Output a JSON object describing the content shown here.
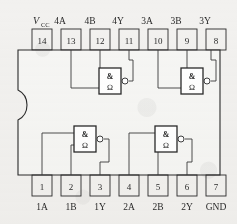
{
  "figure": {
    "kind": "ic-pinout-diagram",
    "device": "quad 2-input NAND (DIP-14)",
    "package_outline_color": "#2a2a2a",
    "background_color": "#f2f1ef",
    "wire_color": "#3a3a3a"
  },
  "pins": {
    "top": [
      {
        "number": "14",
        "label": "V",
        "sub": "CC",
        "is_vcc": true
      },
      {
        "number": "13",
        "label": "4A"
      },
      {
        "number": "12",
        "label": "4B"
      },
      {
        "number": "11",
        "label": "4Y"
      },
      {
        "number": "10",
        "label": "3A"
      },
      {
        "number": "9",
        "label": "3B"
      },
      {
        "number": "8",
        "label": "3Y"
      }
    ],
    "bottom": [
      {
        "number": "1",
        "label": "1A"
      },
      {
        "number": "2",
        "label": "1B"
      },
      {
        "number": "3",
        "label": "1Y"
      },
      {
        "number": "4",
        "label": "2A"
      },
      {
        "number": "5",
        "label": "2B"
      },
      {
        "number": "6",
        "label": "2Y"
      },
      {
        "number": "7",
        "label": "GND"
      }
    ]
  },
  "gates": [
    {
      "id": "gate-4",
      "symbol": "&",
      "inner_glyph": "Ω",
      "inputs": [
        "13",
        "12"
      ],
      "output": "11",
      "position": "top-left"
    },
    {
      "id": "gate-3",
      "symbol": "&",
      "inner_glyph": "Ω",
      "inputs": [
        "10",
        "9"
      ],
      "output": "8",
      "position": "top-right"
    },
    {
      "id": "gate-1",
      "symbol": "&",
      "inner_glyph": "Ω",
      "inputs": [
        "1",
        "2"
      ],
      "output": "3",
      "position": "bottom-left"
    },
    {
      "id": "gate-2",
      "symbol": "&",
      "inner_glyph": "Ω",
      "inputs": [
        "4",
        "5"
      ],
      "output": "6",
      "position": "bottom-right"
    }
  ]
}
